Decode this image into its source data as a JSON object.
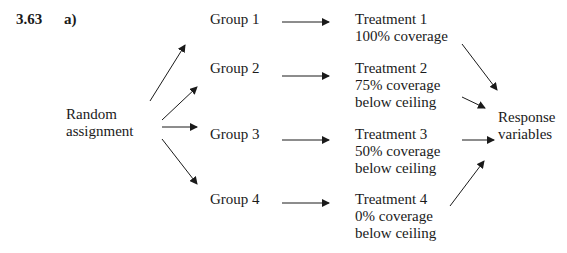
{
  "problem": {
    "number": "3.63",
    "part": "a)"
  },
  "source": {
    "line1": "Random",
    "line2": "assignment"
  },
  "groups": [
    {
      "label": "Group 1"
    },
    {
      "label": "Group 2"
    },
    {
      "label": "Group 3"
    },
    {
      "label": "Group 4"
    }
  ],
  "treatments": [
    {
      "line1": "Treatment 1",
      "line2": "100% coverage",
      "line3": ""
    },
    {
      "line1": "Treatment 2",
      "line2": "75% coverage",
      "line3": "below ceiling"
    },
    {
      "line1": "Treatment 3",
      "line2": "50% coverage",
      "line3": "below ceiling"
    },
    {
      "line1": "Treatment 4",
      "line2": "0% coverage",
      "line3": "below ceiling"
    }
  ],
  "outcome": {
    "line1": "Response",
    "line2": "variables"
  },
  "colors": {
    "ink": "#1a1a1a",
    "background": "#ffffff"
  }
}
